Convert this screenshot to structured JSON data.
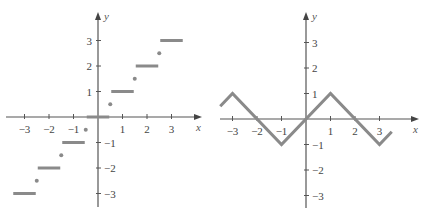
{
  "chart_data": [
    {
      "type": "line",
      "title": "",
      "description": "Step function (round to nearest integer); open/closed points at half-integers",
      "xlabel": "x",
      "ylabel": "y",
      "xlim": [
        -3.5,
        3.5
      ],
      "ylim": [
        -3.5,
        3.5
      ],
      "x_ticks": [
        -3,
        -2,
        -1,
        1,
        2,
        3
      ],
      "y_ticks": [
        -3,
        -2,
        -1,
        1,
        2,
        3
      ],
      "x_tick_labels": [
        "−3",
        "−2",
        "−1",
        "1",
        "2",
        "3"
      ],
      "y_tick_labels": [
        "−3",
        "−2",
        "−1",
        "1",
        "2",
        "3"
      ],
      "grid": false,
      "segments": [
        {
          "x": [
            -3.5,
            -2.5
          ],
          "y": -3
        },
        {
          "x": [
            -2.5,
            -1.5
          ],
          "y": -2
        },
        {
          "x": [
            -1.5,
            -0.5
          ],
          "y": -1
        },
        {
          "x": [
            -0.5,
            0.5
          ],
          "y": 0
        },
        {
          "x": [
            0.5,
            1.5
          ],
          "y": 1
        },
        {
          "x": [
            1.5,
            2.5
          ],
          "y": 2
        },
        {
          "x": [
            2.5,
            3.5
          ],
          "y": 3
        }
      ],
      "points": [
        {
          "x": -2.5,
          "y": -2.5
        },
        {
          "x": -1.5,
          "y": -1.5
        },
        {
          "x": -0.5,
          "y": -0.5
        },
        {
          "x": 0.5,
          "y": 0.5
        },
        {
          "x": 1.5,
          "y": 1.5
        },
        {
          "x": 2.5,
          "y": 2.5
        }
      ]
    },
    {
      "type": "line",
      "title": "",
      "description": "Triangle wave, period 4, amplitude 1",
      "xlabel": "x",
      "ylabel": "y",
      "xlim": [
        -3.5,
        3.5
      ],
      "ylim": [
        -3.5,
        3.5
      ],
      "x_ticks": [
        -3,
        -2,
        -1,
        1,
        2,
        3
      ],
      "y_ticks": [
        -3,
        -2,
        -1,
        1,
        2,
        3
      ],
      "x_tick_labels": [
        "−3",
        "−2",
        "−1",
        "1",
        "2",
        "3"
      ],
      "y_tick_labels": [
        "−3",
        "−2",
        "−1",
        "1",
        "2",
        "3"
      ],
      "grid": false,
      "x": [
        -3.5,
        -3,
        -1,
        1,
        3,
        3.5
      ],
      "y": [
        0.5,
        1,
        -1,
        1,
        -1,
        -0.5
      ]
    }
  ]
}
